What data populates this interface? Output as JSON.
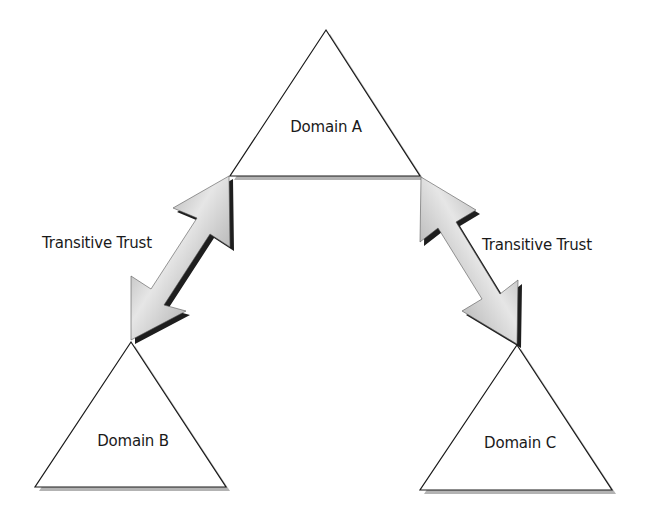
{
  "diagram": {
    "type": "trust-hierarchy",
    "colors": {
      "background": "#ffffff",
      "triangle_fill": "#ffffff",
      "triangle_stroke": "#1a1a1a",
      "triangle_shadow": "#9a9a9a",
      "arrow_light": "#e6e6e6",
      "arrow_dark": "#8c8c8c",
      "arrow_shadow": "#1e1e1e",
      "text": "#1a1a1a"
    },
    "domains": [
      {
        "id": "domain-a",
        "label": "Domain A",
        "role": "parent"
      },
      {
        "id": "domain-b",
        "label": "Domain B",
        "role": "child"
      },
      {
        "id": "domain-c",
        "label": "Domain C",
        "role": "child"
      }
    ],
    "trusts": [
      {
        "from": "Domain A",
        "to": "Domain B",
        "label": "Transitive Trust",
        "direction": "bidirectional"
      },
      {
        "from": "Domain A",
        "to": "Domain C",
        "label": "Transitive Trust",
        "direction": "bidirectional"
      }
    ]
  }
}
